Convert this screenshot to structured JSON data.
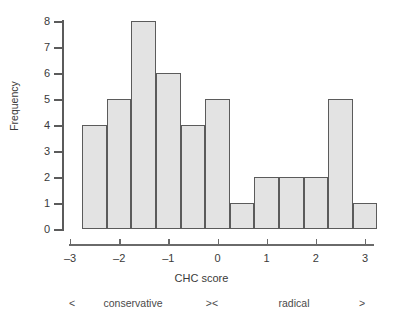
{
  "chart_data": {
    "type": "bar",
    "title": "",
    "xlabel": "CHC score",
    "ylabel": "Frequency",
    "xlim": [
      -3,
      3.4
    ],
    "ylim": [
      0,
      8
    ],
    "bin_width": 0.5,
    "grid": false,
    "legend": null,
    "bin_edges": [
      -2.75,
      -2.25,
      -1.75,
      -1.25,
      -0.75,
      -0.25,
      0.25,
      0.75,
      1.25,
      1.75,
      2.25,
      2.75,
      3.25
    ],
    "bin_centers": [
      -2.5,
      -2.0,
      -1.5,
      -1.0,
      -0.5,
      0.0,
      0.5,
      1.0,
      1.5,
      2.0,
      2.5,
      3.0
    ],
    "values": [
      4,
      5,
      8,
      6,
      4,
      5,
      1,
      2,
      2,
      2,
      5,
      1
    ],
    "x_ticks": [
      -3,
      -2,
      -1,
      0,
      1,
      2,
      3
    ],
    "x_tick_labels": [
      "–3",
      "–2",
      "–1",
      "0",
      "1",
      "2",
      "3"
    ],
    "y_ticks": [
      0,
      1,
      2,
      3,
      4,
      5,
      6,
      7,
      8
    ],
    "y_tick_labels": [
      "0",
      "1",
      "2",
      "3",
      "4",
      "5",
      "6",
      "7",
      "8"
    ],
    "bar_fill_color": "#e3e3e3",
    "bar_edge_color": "#5b5b5b",
    "axis_color": "#5b5b5b",
    "background_color": "#ffffff"
  },
  "annotations": {
    "left_arrow": "<",
    "conservative_label": "conservative",
    "middle_arrows": "><",
    "radical_label": "radical",
    "right_arrow": ">"
  }
}
